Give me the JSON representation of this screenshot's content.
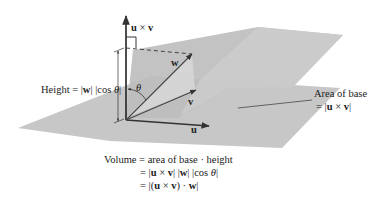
{
  "figure": {
    "type": "parallelepiped-volume-diagram",
    "vectors": {
      "u": "u",
      "v": "v",
      "w": "w",
      "cross": "u × v"
    },
    "angle_label": "θ",
    "labels": {
      "height_prefix": "Height = |",
      "height_w": "w",
      "height_mid": "| |cos ",
      "height_theta": "θ",
      "height_suffix": "|",
      "area_line1": "Area of base",
      "area_prefix": "= |",
      "area_u": "u",
      "area_times": " × ",
      "area_v": "v",
      "area_suffix": "|"
    },
    "volume": {
      "line1": "Volume = area of base · height",
      "line2_prefix": "= |",
      "line2_u": "u",
      "line2_times": " × ",
      "line2_v": "v",
      "line2_mid": "| |",
      "line2_w": "w",
      "line2_cos": "| |cos ",
      "line2_theta": "θ",
      "line2_suffix": "|",
      "line3_prefix": "= |(",
      "line3_u": "u",
      "line3_times": " × ",
      "line3_v": "v",
      "line3_dot": ") · ",
      "line3_w": "w",
      "line3_suffix": "|"
    },
    "colors": {
      "base_plane": "#c4c4c4",
      "top_plane": "#b9b9b9",
      "side_face": "#cfcfcf",
      "arrow": "#333333"
    }
  }
}
